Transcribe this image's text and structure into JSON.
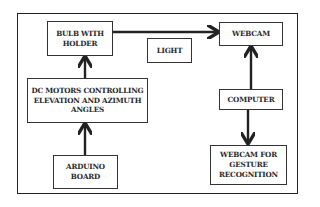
{
  "diagram": {
    "nodes": {
      "bulb": "BULB WITH\nHOLDER",
      "light": "LIGHT",
      "webcam": "WEBCAM",
      "dc_motors": "DC MOTORS CONTROLLING\nELEVATION AND AZIMUTH\nANGLES",
      "arduino": "ARDUINO\nBOARD",
      "computer": "COMPUTER",
      "webcam_gesture": "WEBCAM FOR\nGESTURE\nRECOGNITION"
    },
    "edges": [
      {
        "from": "arduino",
        "to": "dc_motors"
      },
      {
        "from": "dc_motors",
        "to": "bulb"
      },
      {
        "from": "bulb",
        "to": "webcam",
        "label": "LIGHT"
      },
      {
        "from": "computer",
        "to": "webcam"
      },
      {
        "from": "computer",
        "to": "webcam_gesture"
      }
    ],
    "colors": {
      "line": "#222222",
      "box_border": "#333333",
      "background": "#ffffff"
    }
  }
}
